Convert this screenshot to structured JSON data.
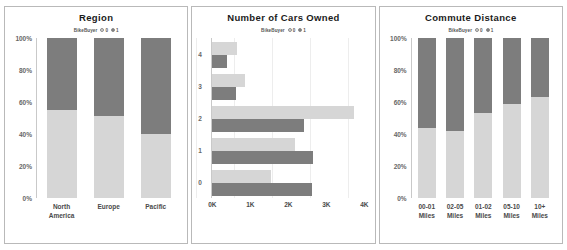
{
  "legend": {
    "title": "BikeBuyer",
    "items": [
      {
        "label": "0",
        "color": "#d6d6d6"
      },
      {
        "label": "1",
        "color": "#7d7d7d"
      }
    ]
  },
  "colors": {
    "series_0": "#d6d6d6",
    "series_1": "#7d7d7d",
    "panel_border": "#b9b9b9",
    "axis": "#c9c9c9",
    "text": "#4a4a4a"
  },
  "panels": [
    {
      "id": "region",
      "title": "Region"
    },
    {
      "id": "cars",
      "title": "Number of Cars Owned"
    },
    {
      "id": "commute",
      "title": "Commute Distance"
    }
  ],
  "chart_data": [
    {
      "type": "bar",
      "id": "region",
      "orientation": "vertical",
      "stacked": true,
      "normalized": true,
      "title": "Region",
      "xlabel": "",
      "ylabel": "",
      "ylim": [
        0,
        100
      ],
      "ytick_labels": [
        "100%",
        "80%",
        "60%",
        "40%",
        "20%",
        "0%"
      ],
      "ytick_values": [
        100,
        80,
        60,
        40,
        20,
        0
      ],
      "grid": false,
      "legend_position": "top-center",
      "categories": [
        "North\nAmerica",
        "Europe",
        "Pacific"
      ],
      "series": [
        {
          "name": "0",
          "color": "#d6d6d6",
          "values": [
            55,
            51,
            40
          ]
        },
        {
          "name": "1",
          "color": "#7d7d7d",
          "values": [
            45,
            49,
            60
          ]
        }
      ]
    },
    {
      "type": "bar",
      "id": "cars",
      "orientation": "horizontal",
      "stacked": false,
      "title": "Number of Cars Owned",
      "xlabel": "",
      "ylabel": "",
      "xlim": [
        0,
        4000
      ],
      "xtick_labels": [
        "0K",
        "1K",
        "2K",
        "3K",
        "4K"
      ],
      "xtick_values": [
        0,
        1000,
        2000,
        3000,
        4000
      ],
      "grid": true,
      "legend_position": "top-center",
      "categories": [
        "4",
        "3",
        "2",
        "1",
        "0"
      ],
      "series": [
        {
          "name": "0",
          "color": "#d6d6d6",
          "values": [
            640,
            860,
            3740,
            2180,
            1540
          ]
        },
        {
          "name": "1",
          "color": "#7d7d7d",
          "values": [
            390,
            620,
            2420,
            2640,
            2620
          ]
        }
      ]
    },
    {
      "type": "bar",
      "id": "commute",
      "orientation": "vertical",
      "stacked": true,
      "normalized": true,
      "title": "Commute Distance",
      "xlabel": "",
      "ylabel": "",
      "ylim": [
        0,
        100
      ],
      "ytick_labels": [
        "100%",
        "80%",
        "60%",
        "40%",
        "20%",
        "0%"
      ],
      "ytick_values": [
        100,
        80,
        60,
        40,
        20,
        0
      ],
      "grid": false,
      "legend_position": "top-center",
      "categories": [
        "00-01\nMiles",
        "02-05\nMiles",
        "01-02\nMiles",
        "05-10\nMiles",
        "10+\nMiles"
      ],
      "series": [
        {
          "name": "0",
          "color": "#d6d6d6",
          "values": [
            44,
            42,
            53,
            59,
            63
          ]
        },
        {
          "name": "1",
          "color": "#7d7d7d",
          "values": [
            56,
            58,
            47,
            41,
            37
          ]
        }
      ]
    }
  ]
}
